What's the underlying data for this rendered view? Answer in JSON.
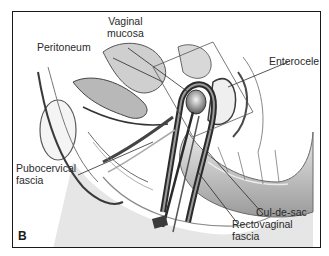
{
  "figure": {
    "panel_letter": "B",
    "labels": {
      "vaginal_mucosa_line1": "Vaginal",
      "vaginal_mucosa_line2": "mucosa",
      "peritoneum": "Peritoneum",
      "enterocele": "Enterocele",
      "pubocervical_line1": "Pubocervical",
      "pubocervical_line2": "fascia",
      "cul_de_sac": "Cul-de-sac",
      "rectovaginal_line1": "Rectovaginal",
      "rectovaginal_line2": "fascia"
    },
    "colors": {
      "border": "#1a1a1a",
      "text": "#2a2a2a",
      "tissue_dark": "#3a3a3a",
      "tissue_mid": "#8a8a8a",
      "tissue_light": "#d0d0d0"
    }
  }
}
